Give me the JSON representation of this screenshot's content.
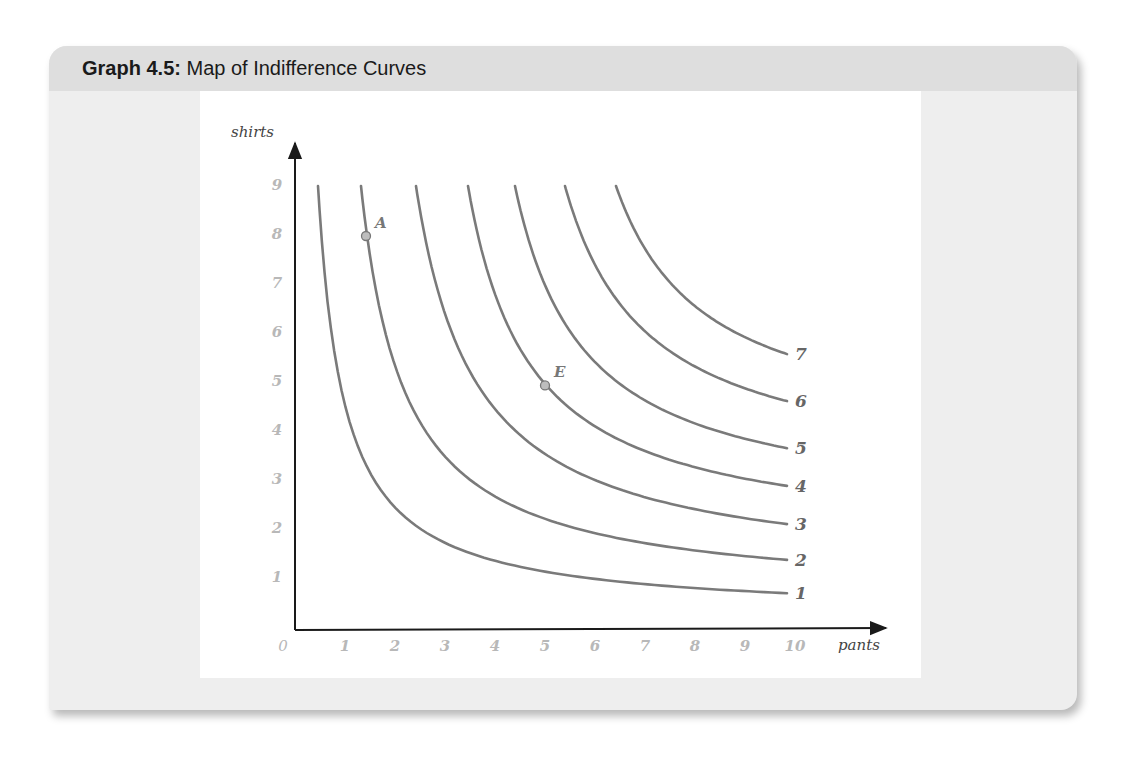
{
  "header": {
    "title_number": "Graph 4.5:",
    "title_text": " Map of Indifference Curves"
  },
  "colors": {
    "card_bg": "#eeeeee",
    "header_bg": "#dedede",
    "panel_bg": "#ffffff",
    "curve": "#7a7a7a",
    "axis": "#1a1a1a",
    "tick_label": "#b8b8b8",
    "point_fill": "#bdbdbd"
  },
  "chart_data": {
    "type": "line",
    "title": "Map of Indifference Curves",
    "figure_label": "Graph 4.5",
    "xlabel": "pants",
    "ylabel": "shirts",
    "xlim": [
      0,
      10.5
    ],
    "ylim": [
      0,
      10
    ],
    "x_ticks": [
      "0",
      "1",
      "2",
      "3",
      "4",
      "5",
      "6",
      "7",
      "8",
      "9",
      "10"
    ],
    "y_ticks": [
      "1",
      "2",
      "3",
      "4",
      "5",
      "6",
      "7",
      "8",
      "9"
    ],
    "grid": false,
    "legend": "inline labels at right end of each curve",
    "series": [
      {
        "name": "1",
        "label": "1",
        "x_top": 0.46,
        "y_end": 0.71,
        "b": 0.25,
        "points": [
          [
            0.46,
            9.0
          ],
          [
            1,
            4.7
          ],
          [
            2,
            2.6
          ],
          [
            4,
            1.5
          ],
          [
            6,
            1.05
          ],
          [
            9.84,
            0.71
          ]
        ]
      },
      {
        "name": "2",
        "label": "2",
        "x_top": 1.32,
        "y_end": 1.39,
        "b": 0.6,
        "points": [
          [
            1.32,
            9.0
          ],
          [
            2,
            6.2
          ],
          [
            3,
            4.1
          ],
          [
            5,
            2.5
          ],
          [
            7,
            1.9
          ],
          [
            9.84,
            1.39
          ]
        ]
      },
      {
        "name": "3",
        "label": "3",
        "x_top": 2.42,
        "y_end": 2.12,
        "b": 1.0,
        "points": [
          [
            2.42,
            9.0
          ],
          [
            3,
            7.3
          ],
          [
            4,
            5.4
          ],
          [
            6,
            3.6
          ],
          [
            8,
            2.7
          ],
          [
            9.84,
            2.12
          ]
        ]
      },
      {
        "name": "4",
        "label": "4",
        "x_top": 3.46,
        "y_end": 2.9,
        "b": 1.7,
        "points": [
          [
            3.46,
            9.0
          ],
          [
            4,
            7.6
          ],
          [
            5,
            4.95
          ],
          [
            7,
            3.7
          ],
          [
            8.5,
            3.2
          ],
          [
            9.84,
            2.9
          ]
        ]
      },
      {
        "name": "5",
        "label": "5",
        "x_top": 4.4,
        "y_end": 3.67,
        "b": 2.3,
        "points": [
          [
            4.4,
            9.0
          ],
          [
            5,
            7.7
          ],
          [
            6,
            6.2
          ],
          [
            7.5,
            4.9
          ],
          [
            8.7,
            4.1
          ],
          [
            9.84,
            3.67
          ]
        ]
      },
      {
        "name": "6",
        "label": "6",
        "x_top": 5.4,
        "y_end": 4.63,
        "b": 3.0,
        "points": [
          [
            5.4,
            9.0
          ],
          [
            6,
            7.9
          ],
          [
            7,
            6.7
          ],
          [
            8,
            5.7
          ],
          [
            9,
            5.0
          ],
          [
            9.84,
            4.63
          ]
        ]
      },
      {
        "name": "7",
        "label": "7",
        "x_top": 6.42,
        "y_end": 5.59,
        "b": 3.8,
        "points": [
          [
            6.42,
            9.0
          ],
          [
            7,
            8.0
          ],
          [
            7.7,
            6.9
          ],
          [
            8.5,
            6.2
          ],
          [
            9.3,
            5.8
          ],
          [
            9.84,
            5.59
          ]
        ]
      }
    ],
    "annotations": [
      {
        "label": "A",
        "x": 1.42,
        "y": 8.0,
        "curve": "2"
      },
      {
        "label": "E",
        "x": 5.0,
        "y": 4.95,
        "curve": "4"
      }
    ]
  }
}
